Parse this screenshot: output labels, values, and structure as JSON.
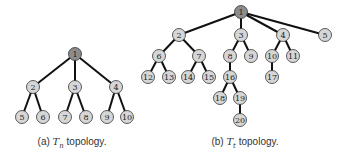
{
  "colors": {
    "root_fill": "#8c8c8c",
    "node_fill": "#d6d6d6",
    "edge": "#111111"
  },
  "figures": [
    {
      "id": "a",
      "caption_prefix": "(a) ",
      "caption_math": "T",
      "caption_sub": "n",
      "caption_suffix": " topology.",
      "caption_x": 72,
      "root": "1",
      "nodes": [
        {
          "id": "1",
          "x": 75,
          "y": 54
        },
        {
          "id": "2",
          "x": 33,
          "y": 87
        },
        {
          "id": "3",
          "x": 75,
          "y": 87
        },
        {
          "id": "4",
          "x": 116,
          "y": 87
        },
        {
          "id": "5",
          "x": 22,
          "y": 117
        },
        {
          "id": "6",
          "x": 43,
          "y": 117
        },
        {
          "id": "7",
          "x": 65,
          "y": 117
        },
        {
          "id": "8",
          "x": 86,
          "y": 117
        },
        {
          "id": "9",
          "x": 107,
          "y": 117
        },
        {
          "id": "10",
          "x": 127,
          "y": 117
        }
      ],
      "edges": [
        [
          "1",
          "2"
        ],
        [
          "1",
          "3"
        ],
        [
          "1",
          "4"
        ],
        [
          "2",
          "5"
        ],
        [
          "2",
          "6"
        ],
        [
          "3",
          "7"
        ],
        [
          "3",
          "8"
        ],
        [
          "4",
          "9"
        ],
        [
          "4",
          "10"
        ]
      ]
    },
    {
      "id": "b",
      "caption_prefix": "(b) ",
      "caption_math": "T",
      "caption_sub": "t",
      "caption_suffix": " topology.",
      "caption_x": 245,
      "root": "1",
      "nodes": [
        {
          "id": "1",
          "x": 241,
          "y": 12
        },
        {
          "id": "2",
          "x": 179,
          "y": 35
        },
        {
          "id": "3",
          "x": 241,
          "y": 35
        },
        {
          "id": "4",
          "x": 283,
          "y": 35
        },
        {
          "id": "5",
          "x": 325,
          "y": 35
        },
        {
          "id": "6",
          "x": 159,
          "y": 56
        },
        {
          "id": "7",
          "x": 199,
          "y": 56
        },
        {
          "id": "8",
          "x": 230,
          "y": 56
        },
        {
          "id": "9",
          "x": 251,
          "y": 56
        },
        {
          "id": "10",
          "x": 272,
          "y": 56
        },
        {
          "id": "11",
          "x": 293,
          "y": 56
        },
        {
          "id": "12",
          "x": 148,
          "y": 77
        },
        {
          "id": "13",
          "x": 169,
          "y": 77
        },
        {
          "id": "14",
          "x": 188,
          "y": 77
        },
        {
          "id": "15",
          "x": 209,
          "y": 77
        },
        {
          "id": "16",
          "x": 230,
          "y": 77
        },
        {
          "id": "17",
          "x": 272,
          "y": 77
        },
        {
          "id": "18",
          "x": 220,
          "y": 98
        },
        {
          "id": "19",
          "x": 240,
          "y": 98
        },
        {
          "id": "20",
          "x": 240,
          "y": 120
        }
      ],
      "edges": [
        [
          "1",
          "2"
        ],
        [
          "1",
          "3"
        ],
        [
          "1",
          "4"
        ],
        [
          "1",
          "5"
        ],
        [
          "2",
          "6"
        ],
        [
          "2",
          "7"
        ],
        [
          "3",
          "8"
        ],
        [
          "3",
          "9"
        ],
        [
          "4",
          "10"
        ],
        [
          "4",
          "11"
        ],
        [
          "6",
          "12"
        ],
        [
          "6",
          "13"
        ],
        [
          "7",
          "14"
        ],
        [
          "7",
          "15"
        ],
        [
          "8",
          "16"
        ],
        [
          "10",
          "17"
        ],
        [
          "16",
          "18"
        ],
        [
          "16",
          "19"
        ],
        [
          "19",
          "20"
        ]
      ]
    }
  ]
}
